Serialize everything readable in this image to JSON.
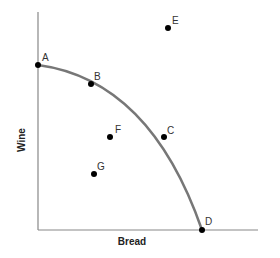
{
  "diagram": {
    "x_axis_label": "Bread",
    "y_axis_label": "Wine",
    "curve_color": "#777777",
    "axis_color": "#888888",
    "points": [
      {
        "label": "A",
        "x": 38,
        "y": 65,
        "on_curve": true
      },
      {
        "label": "B",
        "x": 91,
        "y": 84,
        "on_curve": true
      },
      {
        "label": "C",
        "x": 164,
        "y": 137,
        "on_curve": true
      },
      {
        "label": "D",
        "x": 202,
        "y": 230,
        "on_curve": true
      },
      {
        "label": "E",
        "x": 168,
        "y": 28,
        "on_curve": false
      },
      {
        "label": "F",
        "x": 110,
        "y": 137,
        "on_curve": false
      },
      {
        "label": "G",
        "x": 94,
        "y": 174,
        "on_curve": false
      }
    ]
  }
}
